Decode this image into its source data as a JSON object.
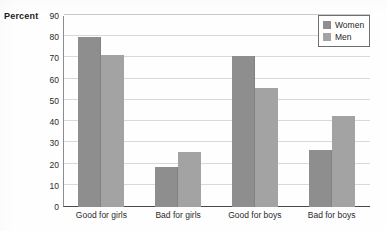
{
  "chart_data": {
    "type": "bar",
    "title": "",
    "subtitle": "",
    "xlabel": "",
    "ylabel": "Percent",
    "categories": [
      "Good for girls",
      "Bad for girls",
      "Good for boys",
      "Bad for boys"
    ],
    "series": [
      {
        "name": "Women",
        "color": "#8e8e8e",
        "values": [
          80,
          19,
          71,
          27
        ]
      },
      {
        "name": "Men",
        "color": "#a3a3a3",
        "values": [
          71.5,
          26,
          56,
          43
        ]
      }
    ],
    "ylim": [
      0,
      90
    ],
    "ytick_step": 10,
    "yticks": [
      0,
      10,
      20,
      30,
      40,
      50,
      60,
      70,
      80,
      90
    ],
    "grid": true,
    "grid_axis": "y",
    "legend_position": "top-right",
    "legend_boxed": true,
    "bar_orientation": "vertical",
    "grouping": "clustered"
  },
  "axis": {
    "y_title": "Percent",
    "tick_labels": [
      "90",
      "80",
      "70",
      "60",
      "50",
      "40",
      "30",
      "20",
      "10",
      "0"
    ]
  },
  "legend": {
    "entries": [
      {
        "label": "Women",
        "swatch": "women-swatch-icon"
      },
      {
        "label": "Men",
        "swatch": "men-swatch-icon"
      }
    ]
  }
}
